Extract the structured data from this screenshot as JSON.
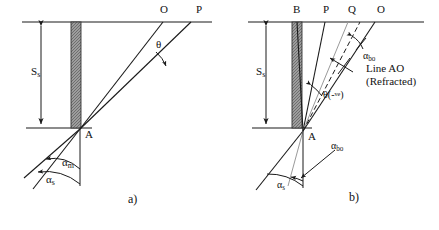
{
  "figure": {
    "title": "",
    "panels": [
      {
        "id": "a",
        "caption": "a)",
        "depth_label": "S",
        "depth_label_sub": "s",
        "point_a": "A",
        "surface_points": [
          {
            "name": "O"
          },
          {
            "name": "P"
          }
        ],
        "angles": [
          {
            "name": "theta",
            "glyph": "θ",
            "sub": ""
          },
          {
            "name": "alpha-m",
            "glyph": "α",
            "sub": "m"
          },
          {
            "name": "alpha-s",
            "glyph": "α",
            "sub": "s"
          }
        ]
      },
      {
        "id": "b",
        "caption": "b)",
        "depth_label": "S",
        "depth_label_sub": "s",
        "point_a": "A",
        "surface_points": [
          {
            "name": "B"
          },
          {
            "name": "P"
          },
          {
            "name": "Q"
          },
          {
            "name": "O"
          }
        ],
        "angles": [
          {
            "name": "theta-negative",
            "glyph": "θ",
            "paren": "(-",
            "sup": "ve",
            "paren_close": ")"
          },
          {
            "name": "alpha-bo-upper",
            "glyph": "α",
            "sub": "bo"
          },
          {
            "name": "alpha-bo-lower",
            "glyph": "α",
            "sub": "bo"
          },
          {
            "name": "alpha-s",
            "glyph": "α",
            "sub": "s"
          }
        ],
        "annotation": {
          "line1": "Line AO",
          "line2": "(Refracted)"
        }
      }
    ],
    "colors": {
      "stroke": "#1a1a1a",
      "hatch_fill": "#8c8c8c",
      "faint_line": "#9a9a9a",
      "background": "#ffffff"
    }
  }
}
